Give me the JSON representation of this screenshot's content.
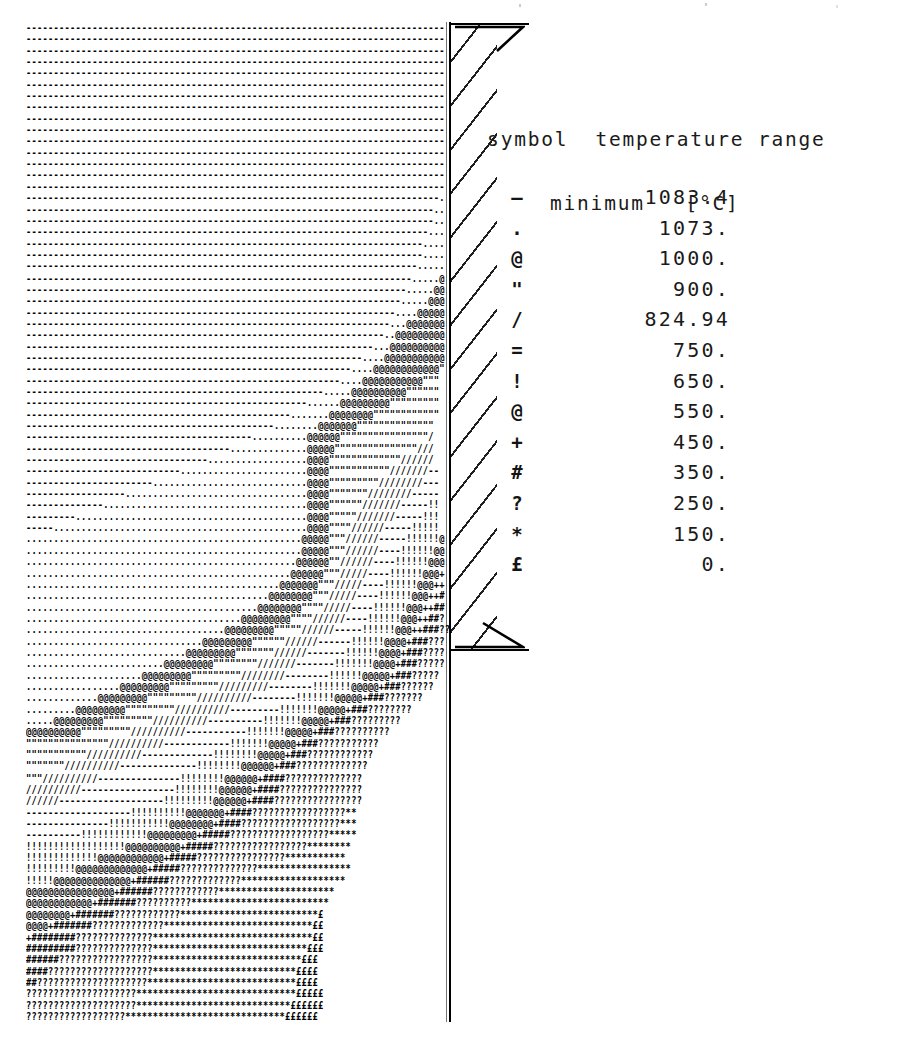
{
  "figure": {
    "kind": "ascii-contour-plot"
  },
  "legend": {
    "header_line_1": "symbol  temperature range",
    "header_line_2": "minimum   [°C]",
    "title_full": "symbol temperature range minimum [°C]",
    "units": "°C",
    "rows": [
      {
        "symbol": "—",
        "value": "1083.4"
      },
      {
        "symbol": ".",
        "value": "1073."
      },
      {
        "symbol": "@",
        "value": "1000."
      },
      {
        "symbol": "\"",
        "value": "900."
      },
      {
        "symbol": "/",
        "value": "824.94"
      },
      {
        "symbol": "=",
        "value": "750."
      },
      {
        "symbol": "!",
        "value": "650."
      },
      {
        "symbol": "@",
        "value": "550."
      },
      {
        "symbol": "+",
        "value": "450."
      },
      {
        "symbol": "#",
        "value": "350."
      },
      {
        "symbol": "?",
        "value": "250."
      },
      {
        "symbol": "*",
        "value": "150."
      },
      {
        "symbol": "£",
        "value": "0."
      }
    ]
  },
  "chart_data": {
    "type": "heatmap",
    "title": "symbol temperature range minimum [°C]",
    "xlabel": "",
    "ylabel": "",
    "rendering": "ascii-character-contour",
    "legend_position": "right",
    "grid": false,
    "value_unit": "°C",
    "categories": [
      "—",
      ".",
      "@",
      "\"",
      "/",
      "=",
      "!",
      "@",
      "+",
      "#",
      "?",
      "*",
      "£"
    ],
    "values": [
      1083.4,
      1073.0,
      1000.0,
      900.0,
      824.94,
      750.0,
      650.0,
      550.0,
      450.0,
      350.0,
      250.0,
      150.0,
      0.0
    ],
    "bands": [
      {
        "symbol": "—",
        "min": 1083.4,
        "label": "1083.4"
      },
      {
        "symbol": ".",
        "min": 1073.0,
        "label": "1073."
      },
      {
        "symbol": "@",
        "min": 1000.0,
        "label": "1000."
      },
      {
        "symbol": "\"",
        "min": 900.0,
        "label": "900."
      },
      {
        "symbol": "/",
        "min": 824.94,
        "label": "824.94"
      },
      {
        "symbol": "=",
        "min": 750.0,
        "label": "750."
      },
      {
        "symbol": "!",
        "min": 650.0,
        "label": "650."
      },
      {
        "symbol": "@",
        "min": 550.0,
        "label": "550."
      },
      {
        "symbol": "+",
        "min": 450.0,
        "label": "450."
      },
      {
        "symbol": "#",
        "min": 350.0,
        "label": "350."
      },
      {
        "symbol": "?",
        "min": 250.0,
        "label": "250."
      },
      {
        "symbol": "*",
        "min": 150.0,
        "label": "150."
      },
      {
        "symbol": "£",
        "min": 0.0,
        "label": "0."
      }
    ],
    "ylim": [
      0,
      1083.4
    ],
    "note": "Contour bands run from hottest (top-left, '—' / '.') to coolest (bottom-right, '£')."
  },
  "ascii_art": {
    "columns": 76,
    "rows": 88,
    "text": "----------------------------------------------------------------------------\n----------------------------------------------------------------------------\n----------------------------------------------------------------------------\n----------------------------------------------------------------------------\n----------------------------------------------------------------------------\n----------------------------------------------------------------------------\n----------------------------------------------------------------------------\n----------------------------------------------------------------------------\n----------------------------------------------------------------------------\n----------------------------------------------------------------------------\n----------------------------------------------------------------------------\n----------------------------------------------------------------------------\n----------------------------------------------------------------------------\n----------------------------------------------------------------------------\n----------------------------------------------------------------------------\n---------------------------------------------------------------------------.\n--------------------------------------------------------------------------..\n--------------------------------------------------------------------------..\n-------------------------------------------------------------------------...\n------------------------------------------------------------------------....\n------------------------------------------------------------------------....\n-----------------------------------------------------------------------.....\n----------------------------------------------------------------------.....@\n---------------------------------------------------------------------.....@@\n--------------------------------------------------------------------.....@@@\n-------------------------------------------------------------------....@@@@@\n------------------------------------------------------------------...@@@@@@@\n-----------------------------------------------------------------..@@@@@@@@@\n---------------------------------------------------------------...@@@@@@@@@@\n-------------------------------------------------------------....@@@@@@@@@@@\n-----------------------------------------------------------....@@@@@@@@@@@@\"\n---------------------------------------------------------....@@@@@@@@@@@\"\"\"\n------------------------------------------------------.....@@@@@@@@@@\"\"\"\"\"\"\n---------------------------------------------------......@@@@@@@@@\"\"\"\"\"\"\"\"\"\n------------------------------------------------.......@@@@@@@@\"\"\"\"\"\"\"\"\"\"\"\"\n---------------------------------------------........@@@@@@@\"\"\"\"\"\"\"\"\"\"\"\"\"\"\n-----------------------------------------..........@@@@@@\"\"\"\"\"\"\"\"\"\"\"\"\"\"\"\"/\n-------------------------------------..............@@@@@\"\"\"\"\"\"\"\"\"\"\"\"\"\"\"///\n---------------------------------..................@@@@\"\"\"\"\"\"\"\"\"\"\"\"\"//////\n----------------------------.......................@@@@\"\"\"\"\"\"\"\"\"\"\"///////--\n-----------------------............................@@@@\"\"\"\"\"\"\"\"\"////////---\n------------------.................................@@@@\"\"\"\"\"\"\"////////-----\n--------------.....................................@@@@\"\"\"\"\"\"///////-----!!\n---------..........................................@@@@\"\"\"\"\"///////-----!!!\n-----..............................................@@@@\"\"\"\"//////-----!!!!!\n..................................................@@@@@\"\"\"//////-----!!!!!!@\n..................................................@@@@@\"\"\"//////----!!!!!!@@\n.................................................@@@@@@\"\"//////----!!!!!!@@@\n................................................@@@@@@\"\"\"/////----!!!!!!@@@+\n..............................................@@@@@@@\"\"\"/////----!!!!!!@@@++\n............................................@@@@@@@@\"\"\"/////----!!!!!!@@@++#\n..........................................@@@@@@@@\"\"\"\"/////----!!!!!!@@@++##\n.......................................@@@@@@@@@\"\"\"\"//////----!!!!!!@@@++##?\n....................................@@@@@@@@@\"\"\"\"\"//////-----!!!!!!@@@++###??\n................................@@@@@@@@@\"\"\"\"\"\"//////------!!!!!!@@@@+###???\n.............................@@@@@@@@@\"\"\"\"\"\"\"//////-------!!!!!!@@@@+###????\n.........................@@@@@@@@@\"\"\"\"\"\"\"\"///////-------!!!!!!!@@@@+###?????\n.....................@@@@@@@@@\"\"\"\"\"\"\"\"\"////////--------!!!!!!@@@@@+###?????\n.................@@@@@@@@@\"\"\"\"\"\"\"\"\"/////////--------!!!!!!!@@@@@+###??????\n.............@@@@@@@@@\"\"\"\"\"\"\"\"\"//////////--------!!!!!!!@@@@@+###???????\n.........@@@@@@@@@\"\"\"\"\"\"\"\"\"//////////---------!!!!!!!@@@@@+###????????\n.....@@@@@@@@@\"\"\"\"\"\"\"\"\"//////////----------!!!!!!!@@@@@+###?????????\n@@@@@@@@@@\"\"\"\"\"\"\"\"\"//////////-----------!!!!!!!@@@@@+###??????????\n\"\"\"\"\"\"\"\"\"\"\"\"\"\"\"//////////------------!!!!!!!@@@@@+###???????????\n\"\"\"\"\"\"\"\"\"\"\"//////////-------------!!!!!!!!@@@@@+###????????????\n\"\"\"\"\"\"\"//////////--------------!!!!!!!!@@@@@@+###?????????????\n\"\"\"//////////---------------!!!!!!!!@@@@@@+####??????????????\n//////////-----------------!!!!!!!!@@@@@@+####???????????????\n//////-------------------!!!!!!!!!@@@@@@+####????????????????\n-------------------!!!!!!!!!!@@@@@@@+####?????????????????**\n---------------!!!!!!!!!!!@@@@@@@@+####??????????????????***\n----------!!!!!!!!!!!!@@@@@@@@@+#####??????????????????*****\n!!!!!!!!!!!!!!!!!!@@@@@@@@@@+#####?????????????????********\n!!!!!!!!!!!!!@@@@@@@@@@@@+#####????????????????***********\n!!!!!!!!!@@@@@@@@@@@@@+#####??????????????*****************\n!!!!!@@@@@@@@@@@@@@+######?????????????*******************\n@@@@@@@@@@@@@@@@+######????????????*********************\n@@@@@@@@@@@@+#######??????????*************************\n@@@@@@@@+#######????????????*************************£\n@@@@+#######?????????????***************************££\n+########??????????????*****************************££\n#########??????????????****************************£££\n######?????????????????***************************£££\n####???????????????????**************************££££\n##????????????????????***************************££££\n????????????????????*****************************£££££\n????????????????????****************************££££££\n??????????????????*****************************££££££"
  }
}
